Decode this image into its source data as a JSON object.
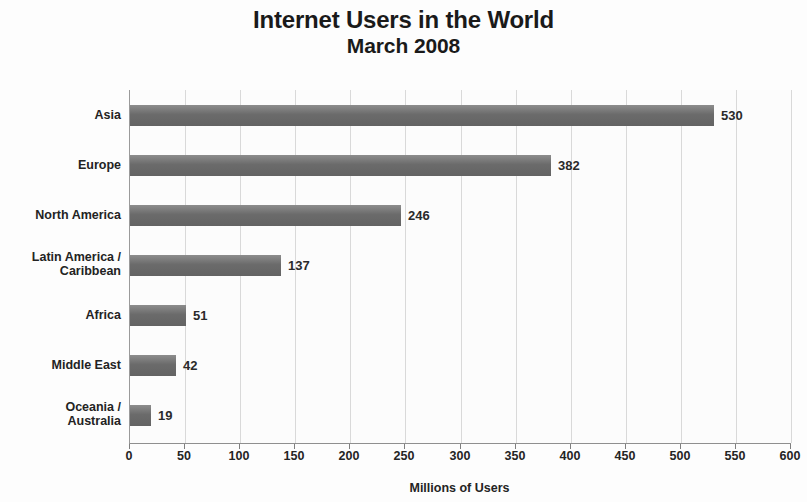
{
  "chart_data": {
    "type": "bar",
    "orientation": "horizontal",
    "title": "Internet Users in the World",
    "subtitle": "March 2008",
    "xlabel": "Millions of Users",
    "ylabel": "",
    "xlim": [
      0,
      600
    ],
    "xticks": [
      0,
      50,
      100,
      150,
      200,
      250,
      300,
      350,
      400,
      450,
      500,
      550,
      600
    ],
    "grid": true,
    "legend": false,
    "bar_color": "#6b6b6b",
    "categories": [
      "Asia",
      "Europe",
      "North America",
      "Latin America /\nCaribbean",
      "Africa",
      "Middle East",
      "Oceania /\nAustralia"
    ],
    "values": [
      530,
      382,
      246,
      137,
      51,
      42,
      19
    ],
    "value_labels": [
      "530",
      "382",
      "246",
      "137",
      "51",
      "42",
      "19"
    ]
  }
}
